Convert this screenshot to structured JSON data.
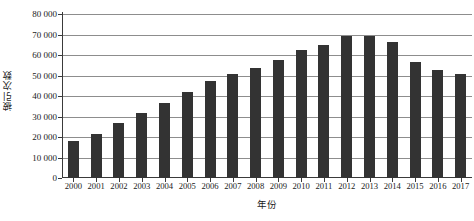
{
  "chart_data": {
    "type": "bar",
    "title": "",
    "xlabel": "年份",
    "ylabel": "被引次数",
    "categories": [
      "2000",
      "2001",
      "2002",
      "2003",
      "2004",
      "2005",
      "2006",
      "2007",
      "2008",
      "2009",
      "2010",
      "2011",
      "2012",
      "2013",
      "2014",
      "2015",
      "2016",
      "2017"
    ],
    "values": [
      18000,
      21500,
      27000,
      31500,
      36500,
      42000,
      47500,
      50500,
      53500,
      57500,
      62500,
      65000,
      69500,
      69500,
      66500,
      56500,
      52500,
      50500
    ],
    "ylim": [
      0,
      80000
    ],
    "ytick_values": [
      0,
      10000,
      20000,
      30000,
      40000,
      50000,
      60000,
      70000,
      80000
    ],
    "ytick_labels": [
      "0",
      "10 000",
      "20 000",
      "30 000",
      "40 000",
      "50 000",
      "60 000",
      "70 000",
      "80 000"
    ],
    "grid": true,
    "legend": null,
    "bar_color": "#333333",
    "gridline_color": "#8d8d8d",
    "axis_color": "#3a3a3a",
    "background_color": "#ffffff"
  }
}
